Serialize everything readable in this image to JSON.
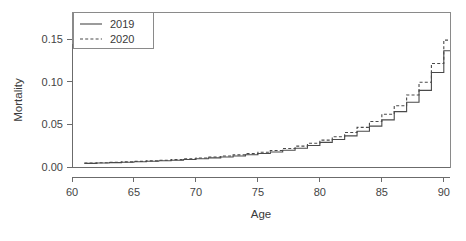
{
  "chart_data": {
    "type": "line",
    "title": "",
    "subtitle": "",
    "xlabel": "Age",
    "ylabel": "Mortality",
    "xlim": [
      60,
      90.5
    ],
    "ylim": [
      0.0,
      0.182
    ],
    "grid": false,
    "legend_position": "top-left",
    "step_style": "hv",
    "x": [
      61,
      62,
      63,
      64,
      65,
      66,
      67,
      68,
      69,
      70,
      71,
      72,
      73,
      74,
      75,
      76,
      77,
      78,
      79,
      80,
      81,
      82,
      83,
      84,
      85,
      86,
      87,
      88,
      89,
      90
    ],
    "xticks": [
      60,
      65,
      70,
      75,
      80,
      85,
      90
    ],
    "xticklabels": [
      "60",
      "65",
      "70",
      "75",
      "80",
      "85",
      "90"
    ],
    "yticks": [
      0.0,
      0.05,
      0.1,
      0.15
    ],
    "yticklabels": [
      "0.00",
      "0.05",
      "0.10",
      "0.15"
    ],
    "series": [
      {
        "name": "2019",
        "style": "solid",
        "color": "#4a4a4a",
        "values": [
          0.0043,
          0.0047,
          0.0051,
          0.0056,
          0.0061,
          0.0067,
          0.0073,
          0.008,
          0.0088,
          0.0097,
          0.0107,
          0.0118,
          0.013,
          0.0143,
          0.0158,
          0.0176,
          0.0196,
          0.022,
          0.0252,
          0.0289,
          0.0323,
          0.0366,
          0.042,
          0.048,
          0.0553,
          0.065,
          0.076,
          0.09,
          0.111,
          0.1365
        ]
      },
      {
        "name": "2020",
        "style": "dashed",
        "color": "#4a4a4a",
        "values": [
          0.0046,
          0.005,
          0.0055,
          0.006,
          0.0066,
          0.0072,
          0.0079,
          0.0087,
          0.0096,
          0.0106,
          0.0117,
          0.0129,
          0.0142,
          0.0157,
          0.0174,
          0.0194,
          0.0217,
          0.0245,
          0.0278,
          0.0315,
          0.0355,
          0.0405,
          0.0465,
          0.0535,
          0.062,
          0.072,
          0.0845,
          0.0995,
          0.1215,
          0.149
        ]
      }
    ],
    "legend_entries": [
      {
        "label": "2019",
        "style": "solid"
      },
      {
        "label": "2020",
        "style": "dashed"
      }
    ],
    "annotations": []
  },
  "colors": {
    "background": "#ffffff",
    "axis": "#6b6b6b",
    "frame": "#8a8a8a",
    "series": "#4a4a4a",
    "text": "#3a3a3a"
  }
}
